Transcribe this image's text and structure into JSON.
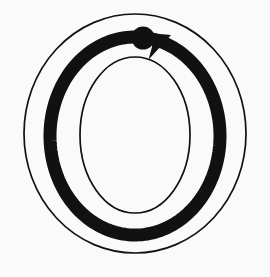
{
  "diagram": {
    "kind": "letter-formation-diagram",
    "letter": "O",
    "title": "Letter O formation guide",
    "description": "Outlined capital letter O with a directional stroke arrow showing a single counterclockwise stroke beginning at the start dot near the top.",
    "stroke_count": 1,
    "direction": "counterclockwise",
    "start_position_label": "top",
    "background_color": "#fafafa",
    "ink_color": "#111111",
    "outline_color": "#111111",
    "arrow_color": "#111111"
  },
  "canvas": {
    "width": 270,
    "height": 277
  },
  "glyph": {
    "name": "letter-o-outline",
    "outer_ellipse": {
      "cx": 135,
      "cy": 133.5,
      "rx": 111,
      "ry": 119.5,
      "stroke_width": 1.7
    },
    "inner_ellipse": {
      "cx": 135,
      "cy": 135,
      "rx": 55,
      "ry": 78,
      "stroke_width": 1.7
    }
  },
  "stroke_arrow": {
    "name": "stroke-1",
    "order": 1,
    "path_ellipse": {
      "cx": 135,
      "cy": 136,
      "rx": 85,
      "ry": 99
    },
    "stroke_width": 13,
    "start_dot": {
      "cx": 143,
      "cy": 38,
      "r": 11.5
    },
    "arrow_tip": {
      "x": 171,
      "y": 35
    },
    "start_angle_deg": -105,
    "end_angle_deg": -68,
    "sweep": "counterclockwise"
  }
}
